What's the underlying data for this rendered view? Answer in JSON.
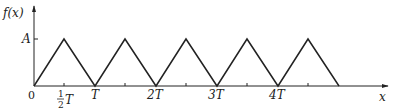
{
  "diagram": {
    "type": "triangle-wave",
    "y_axis_label": "f(x)",
    "x_axis_label": "x",
    "amplitude_label": "A",
    "origin_label": "0",
    "x_ticks": [
      {
        "label_num": "1",
        "label_den": "2",
        "label_suffix": "T",
        "fraction": true
      },
      {
        "label": "T"
      },
      {
        "label": "2T"
      },
      {
        "label": "3T"
      },
      {
        "label": "4T"
      }
    ],
    "periods_shown": 5,
    "line_color": "#222222"
  }
}
